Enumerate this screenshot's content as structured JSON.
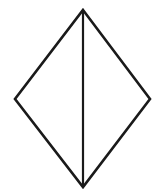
{
  "figure": {
    "canvas": {
      "width": 158,
      "height": 192,
      "background_color": "#ffffff"
    },
    "style": {
      "stroke_color": "#1a1a1a",
      "outline_stroke_width": 2.6,
      "divider_stroke_width": 2.2,
      "fill_color": "#ffffff",
      "line_join": "miter",
      "line_cap": "butt"
    },
    "vertices": {
      "top": {
        "label": "top-vertex",
        "x": 83,
        "y": 10
      },
      "left": {
        "label": "left-vertex",
        "x": 15,
        "y": 99
      },
      "right": {
        "label": "right-vertex",
        "x": 150,
        "y": 99
      },
      "bottom": {
        "label": "bottom-vertex",
        "x": 83,
        "y": 187
      }
    },
    "outline_path": "M 83 10 L 150 99 L 83 187 L 15 99 Z",
    "divider_path": "M 83 10 L 83 187",
    "measurements": {
      "horizontal_diagonal": 135,
      "vertical_diagonal": 177,
      "upper_height": 89,
      "lower_height": 88
    },
    "labels": {
      "shape_name": "rhombus-outline",
      "divider_name": "vertical-divider",
      "left_region": "left-half",
      "right_region": "right-half"
    }
  }
}
